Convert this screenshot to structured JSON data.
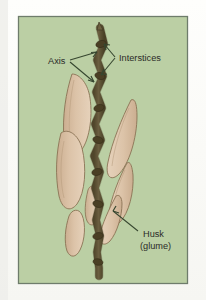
{
  "figure": {
    "background_color": "#fdfdfb",
    "panel_color": "#b9ceа0",
    "panel_fill": "#b8cda0",
    "panel_border_color": "#6d7b6a",
    "panel": {
      "x": 18,
      "y": 16,
      "width": 170,
      "height": 268
    }
  },
  "labels": [
    {
      "id": "axis",
      "text": "Axis",
      "x": 48,
      "y": 63,
      "anchor": "start",
      "color": "#2b2b28",
      "leader_color": "#3a4a33"
    },
    {
      "id": "interstices",
      "text": "Interstices",
      "x": 118,
      "y": 60,
      "anchor": "start",
      "color": "#2b2b28",
      "leader_color": "#3a4a33"
    },
    {
      "id": "husk-line-1",
      "text": "Husk",
      "x": 143,
      "y": 235,
      "anchor": "start",
      "color": "#2b2b28",
      "leader_color": "#3a4a33"
    },
    {
      "id": "husk-line-2",
      "text": "(glume)",
      "x": 140,
      "y": 247,
      "anchor": "start",
      "color": "#2b2b28",
      "leader_color": "#3a4a33"
    }
  ],
  "colors": {
    "panel_green": "#b8cda0",
    "panel_green_light": "#c2d4ac",
    "panel_border": "#6e7c6b",
    "axis_brown": "#6e6141",
    "axis_brown_dark": "#4f4529",
    "axis_outline": "#3f3823",
    "husk_fill": "#d9c0a5",
    "husk_fill_light": "#e3cdb4",
    "husk_outline": "#8a7355",
    "leader": "#36462f",
    "text": "#2b2b28"
  },
  "anatomy": {
    "axis_label": "Axis",
    "interstices_label": "Interstices",
    "husk_label": "Husk",
    "glume_label": "(glume)"
  }
}
